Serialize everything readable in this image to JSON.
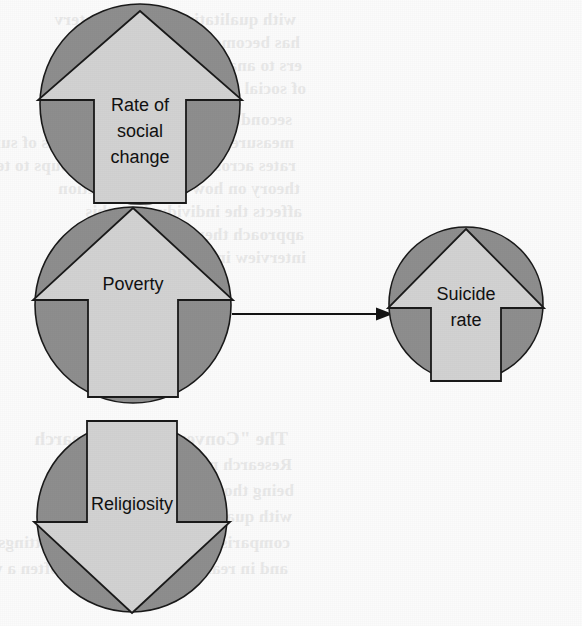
{
  "figure": {
    "kind": "causal-diagram",
    "width": 582,
    "height": 626,
    "background_color": "#fbfbfb"
  },
  "palette": {
    "circle_fill": "#8e8e8e",
    "arrow_fill": "#d2d2d2",
    "outline": "#1a1a1a",
    "text": "#111111",
    "connector": "#141414",
    "bleed_text": "#e9e9e9"
  },
  "nodes": [
    {
      "id": "rate-of-social-change",
      "label": "Rate of\nsocial\nchange",
      "label_lines": [
        "Rate of",
        "social",
        "change"
      ],
      "direction": "up",
      "circle": {
        "cx": 140,
        "cy": 104,
        "r": 100
      },
      "arrow": {
        "tip_x": 140,
        "tip_y": 11,
        "head_half_width": 102,
        "head_bottom_y": 100,
        "shaft_half_width": 46,
        "bottom_y": 203
      },
      "text_x": 140,
      "text_first_line_y": 106,
      "line_height": 26
    },
    {
      "id": "poverty",
      "label": "Poverty",
      "label_lines": [
        "Poverty"
      ],
      "direction": "up",
      "circle": {
        "cx": 133,
        "cy": 305,
        "r": 98
      },
      "arrow": {
        "tip_x": 133,
        "tip_y": 208,
        "head_half_width": 100,
        "head_bottom_y": 300,
        "shaft_half_width": 45,
        "bottom_y": 397
      },
      "text_x": 133,
      "text_first_line_y": 285,
      "line_height": 26
    },
    {
      "id": "religiosity",
      "label": "Religiosity",
      "label_lines": [
        "Religiosity"
      ],
      "direction": "down",
      "circle": {
        "cx": 132,
        "cy": 517,
        "r": 95
      },
      "arrow": {
        "tip_x": 132,
        "tip_y": 613,
        "head_half_width": 98,
        "head_top_y": 522,
        "shaft_half_width": 45,
        "top_y": 421
      },
      "text_x": 132,
      "text_first_line_y": 505,
      "line_height": 26
    },
    {
      "id": "suicide-rate",
      "label": "Suicide\nrate",
      "label_lines": [
        "Suicide",
        "rate"
      ],
      "direction": "up",
      "circle": {
        "cx": 466,
        "cy": 304,
        "r": 77
      },
      "arrow": {
        "tip_x": 466,
        "tip_y": 229,
        "head_half_width": 78,
        "head_bottom_y": 308,
        "shaft_half_width": 35,
        "bottom_y": 381
      },
      "text_x": 466,
      "text_first_line_y": 295,
      "line_height": 26
    }
  ],
  "connectors": [
    {
      "id": "poverty-to-suicide-rate",
      "from": "poverty",
      "to": "suicide-rate",
      "x1": 232,
      "y1": 314,
      "x2": 393,
      "y2": 314,
      "arrowhead": "end"
    }
  ],
  "bleed_through_text": {
    "note": "faint mirrored show-through from the reverse side of the scanned page",
    "lines": [
      {
        "text": "with qualitative research, interv",
        "x": 296,
        "y": 10,
        "heading": false
      },
      {
        "text": "has become exclusively the do",
        "x": 300,
        "y": 33,
        "heading": false
      },
      {
        "text": "ers to analyse a distinct rang",
        "x": 302,
        "y": 56,
        "heading": false
      },
      {
        "text": "of social relationships.",
        "x": 306,
        "y": 79,
        "heading": false
      },
      {
        "text": "second is a study in which the",
        "x": 292,
        "y": 110,
        "heading": false
      },
      {
        "text": "measure quantitatively the events of suicide",
        "x": 294,
        "y": 133,
        "heading": false
      },
      {
        "text": "rates across different social groups to test a",
        "x": 296,
        "y": 156,
        "heading": false
      },
      {
        "text": "theory on how social interaction",
        "x": 300,
        "y": 179,
        "heading": false
      },
      {
        "text": "affects the individual. In this",
        "x": 302,
        "y": 202,
        "heading": false
      },
      {
        "text": "approach there was no need to",
        "x": 304,
        "y": 225,
        "heading": false
      },
      {
        "text": "interview individual people.",
        "x": 306,
        "y": 248,
        "heading": false
      },
      {
        "text": "The \"Conventional\" Research",
        "x": 288,
        "y": 428,
        "heading": true
      },
      {
        "text": "Research models are believed",
        "x": 292,
        "y": 455,
        "heading": false
      },
      {
        "text": "being thought out and are",
        "x": 294,
        "y": 481,
        "heading": false
      },
      {
        "text": "with quantitative research and",
        "x": 292,
        "y": 507,
        "heading": false
      },
      {
        "text": "comparison with knowledge of settings",
        "x": 290,
        "y": 533,
        "heading": false
      },
      {
        "text": "and in reality. The \"model\" is often a way to",
        "x": 288,
        "y": 559,
        "heading": false
      }
    ]
  }
}
